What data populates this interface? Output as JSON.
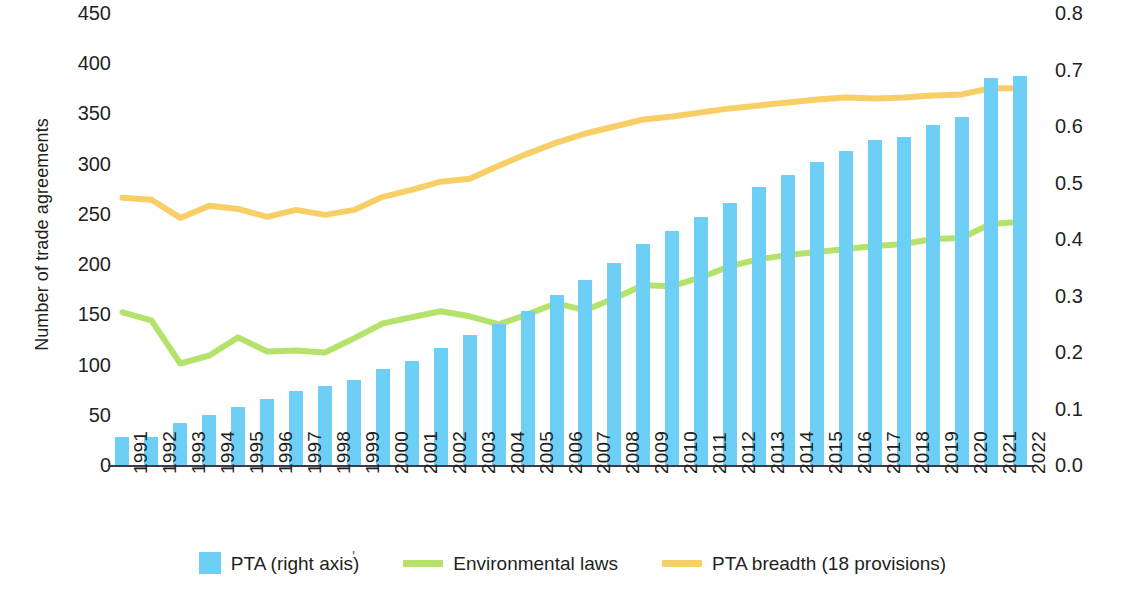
{
  "axes": {
    "left_title": "Number of trade agreements",
    "right_title": "Share of trade agreements",
    "left_ticks": [
      "450",
      "400",
      "350",
      "300",
      "250",
      "200",
      "150",
      "100",
      "50",
      "0"
    ],
    "right_ticks": [
      "0.8",
      "0.7",
      "0.6",
      "0.5",
      "0.4",
      "0.3",
      "0.2",
      "0.1",
      "0.0"
    ]
  },
  "legend": {
    "items": [
      {
        "label": "PTA (right axis)",
        "color": "#6dcff6",
        "marker": "bar-swatch"
      },
      {
        "label": "Environmental laws",
        "color": "#b5e26a",
        "marker": "line-swatch"
      },
      {
        "label": "PTA breadth (18 provisions)",
        "color": "#f7cf66",
        "marker": "line-swatch"
      }
    ],
    "stray_mark": "'"
  },
  "chart_data": {
    "type": "bar",
    "title": "",
    "xlabel": "",
    "ylabel": "Number of trade agreements",
    "y2label": "Share of trade agreements",
    "ylim": [
      0,
      450
    ],
    "y2lim": [
      0.0,
      0.8
    ],
    "grid": false,
    "legend_position": "bottom",
    "categories": [
      "1991",
      "1992",
      "1993",
      "1994",
      "1995",
      "1996",
      "1997",
      "1998",
      "1999",
      "2000",
      "2001",
      "2002",
      "2003",
      "2004",
      "2005",
      "2006",
      "2007",
      "2008",
      "2009",
      "2010",
      "2011",
      "2012",
      "2013",
      "2014",
      "2015",
      "2016",
      "2017",
      "2018",
      "2019",
      "2020",
      "2021",
      "2022"
    ],
    "series": [
      {
        "name": "PTA (right axis)",
        "type": "bar",
        "axis": "left",
        "color": "#6dcff6",
        "values": [
          29,
          29,
          43,
          51,
          59,
          67,
          75,
          80,
          86,
          97,
          105,
          117,
          130,
          141,
          154,
          170,
          185,
          202,
          221,
          234,
          248,
          262,
          278,
          290,
          303,
          314,
          325,
          328,
          340,
          347,
          386,
          388
        ]
      },
      {
        "name": "Environmental laws",
        "type": "line",
        "axis": "left",
        "color": "#b5e26a",
        "values": [
          153,
          145,
          102,
          110,
          128,
          114,
          115,
          113,
          127,
          142,
          148,
          154,
          149,
          141,
          151,
          162,
          155,
          167,
          180,
          179,
          188,
          199,
          206,
          210,
          213,
          216,
          219,
          221,
          226,
          227,
          241,
          243
        ]
      },
      {
        "name": "PTA breadth (18 provisions)",
        "type": "line",
        "axis": "left",
        "color": "#f7cf66",
        "values": [
          267,
          265,
          247,
          259,
          256,
          248,
          255,
          250,
          255,
          268,
          275,
          283,
          286,
          299,
          311,
          322,
          331,
          338,
          345,
          348,
          352,
          356,
          359,
          362,
          365,
          367,
          366,
          367,
          369,
          370,
          376,
          376
        ]
      }
    ],
    "secondary_axis_note": "Right axis (Share of trade agreements) maps 0.0-0.8 onto the same plot height as left axis 0-450"
  }
}
